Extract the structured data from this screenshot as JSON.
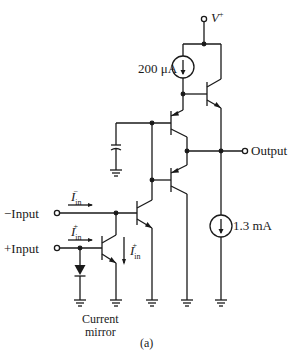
{
  "diagram": {
    "type": "circuit-schematic",
    "figure_label": "(a)",
    "supply": {
      "label": "V",
      "superscript": "+"
    },
    "current_sources": [
      {
        "id": "top-source",
        "label": "200 μA"
      },
      {
        "id": "output-sink",
        "label": "1.3 mA"
      }
    ],
    "terminals": {
      "output": "Output",
      "neg_input": "−Input",
      "pos_input": "+Input"
    },
    "currents": {
      "i_in_minus": {
        "symbol": "I",
        "sub": "in",
        "sup": "−"
      },
      "i_in_plus": {
        "symbol": "I",
        "sub": "in",
        "sup": "+"
      },
      "i_in_plus_mirror": {
        "symbol": "I",
        "sub": "in",
        "sup": "+"
      }
    },
    "annotations": {
      "mirror_line1": "Current",
      "mirror_line2": "mirror"
    },
    "colors": {
      "ink": "#1a1a1a",
      "background": "#ffffff"
    }
  }
}
